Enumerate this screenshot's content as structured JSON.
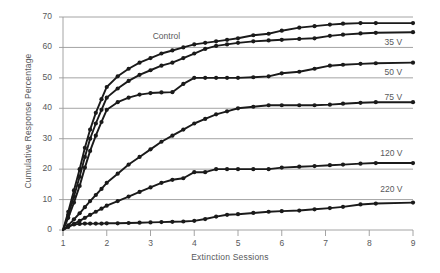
{
  "chart_data": {
    "type": "line",
    "title": "",
    "xlabel": "Extinction Sessions",
    "ylabel": "Cumulative Response Percentage",
    "xlim": [
      1,
      9
    ],
    "ylim": [
      0,
      70
    ],
    "xticks": [
      "1",
      "2",
      "3",
      "4",
      "5",
      "6",
      "7",
      "8",
      "9"
    ],
    "yticks": [
      "0",
      "10",
      "20",
      "30",
      "40",
      "50",
      "60",
      "70"
    ],
    "grid": "horizontal",
    "legend_position": "inline-right",
    "line_color": "#1a1a1a",
    "grid_color": "#9a9a9a",
    "text_color": "#58595b",
    "marker": "filled-circle",
    "series": [
      {
        "name": "Control",
        "label": "Control",
        "label_x": 3.05,
        "label_y": 63.5,
        "x": [
          1.0,
          1.12,
          1.25,
          1.38,
          1.5,
          1.62,
          1.75,
          1.88,
          2.0,
          2.25,
          2.5,
          2.75,
          3.0,
          3.25,
          3.5,
          3.75,
          4.0,
          4.25,
          4.5,
          4.75,
          5.0,
          5.35,
          5.7,
          6.0,
          6.4,
          6.75,
          7.1,
          7.4,
          7.8,
          8.15,
          9.0
        ],
        "values": [
          0.0,
          6.0,
          13.0,
          20.0,
          27.0,
          33.0,
          38.5,
          43.0,
          47.0,
          50.5,
          53.0,
          55.0,
          56.5,
          58.0,
          59.0,
          60.0,
          61.0,
          61.5,
          62.0,
          62.5,
          63.0,
          64.0,
          64.5,
          65.5,
          66.5,
          67.0,
          67.5,
          67.8,
          68.0,
          68.0,
          68.0
        ]
      },
      {
        "name": "35 V",
        "label": "35 V",
        "label_x": 8.35,
        "label_y": 61.5,
        "x": [
          1.0,
          1.12,
          1.25,
          1.38,
          1.5,
          1.62,
          1.75,
          1.88,
          2.0,
          2.25,
          2.5,
          2.75,
          3.0,
          3.25,
          3.5,
          3.75,
          4.0,
          4.25,
          4.5,
          4.75,
          5.0,
          5.35,
          5.7,
          6.0,
          6.4,
          6.75,
          7.1,
          7.4,
          7.8,
          8.15,
          9.0
        ],
        "values": [
          0.0,
          5.0,
          11.0,
          17.5,
          24.0,
          30.0,
          35.0,
          39.5,
          43.5,
          46.5,
          49.0,
          51.0,
          52.5,
          54.0,
          55.0,
          56.5,
          58.0,
          59.5,
          60.5,
          61.0,
          61.5,
          62.0,
          62.3,
          62.5,
          62.8,
          63.0,
          63.8,
          64.2,
          64.6,
          64.8,
          65.0
        ]
      },
      {
        "name": "50 V",
        "label": "50 V",
        "label_x": 8.35,
        "label_y": 51.5,
        "x": [
          1.0,
          1.12,
          1.25,
          1.38,
          1.5,
          1.62,
          1.75,
          1.88,
          2.0,
          2.25,
          2.5,
          2.75,
          3.0,
          3.25,
          3.5,
          3.75,
          4.0,
          4.25,
          4.5,
          4.75,
          5.0,
          5.35,
          5.7,
          6.0,
          6.4,
          6.75,
          7.1,
          7.4,
          7.8,
          8.15,
          9.0
        ],
        "values": [
          0.0,
          4.0,
          9.0,
          14.5,
          20.5,
          26.0,
          31.0,
          35.5,
          39.5,
          42.0,
          43.5,
          44.5,
          45.0,
          45.2,
          45.3,
          48.0,
          50.0,
          50.0,
          50.0,
          50.0,
          50.0,
          50.2,
          50.5,
          51.5,
          52.0,
          53.0,
          54.0,
          54.3,
          54.6,
          54.8,
          55.0
        ]
      },
      {
        "name": "75 V",
        "label": "75 V",
        "label_x": 8.35,
        "label_y": 43.5,
        "x": [
          1.0,
          1.12,
          1.25,
          1.38,
          1.5,
          1.62,
          1.75,
          1.88,
          2.0,
          2.25,
          2.5,
          2.75,
          3.0,
          3.25,
          3.5,
          3.75,
          4.0,
          4.25,
          4.5,
          4.75,
          5.0,
          5.35,
          5.7,
          6.0,
          6.4,
          6.75,
          7.1,
          7.4,
          7.8,
          8.15,
          9.0
        ],
        "values": [
          0.0,
          1.5,
          3.5,
          5.5,
          7.5,
          9.5,
          11.5,
          13.5,
          15.5,
          18.5,
          21.5,
          24.0,
          26.5,
          29.0,
          31.0,
          33.0,
          35.0,
          36.5,
          38.0,
          39.0,
          40.0,
          40.5,
          41.0,
          41.0,
          41.0,
          41.0,
          41.2,
          41.5,
          41.8,
          42.0,
          42.0
        ]
      },
      {
        "name": "120 V",
        "label": "120 V",
        "label_x": 8.25,
        "label_y": 25.0,
        "x": [
          1.0,
          1.12,
          1.25,
          1.38,
          1.5,
          1.62,
          1.75,
          1.88,
          2.0,
          2.25,
          2.5,
          2.75,
          3.0,
          3.25,
          3.5,
          3.75,
          4.0,
          4.25,
          4.5,
          4.75,
          5.0,
          5.35,
          5.7,
          6.0,
          6.4,
          6.75,
          7.1,
          7.4,
          7.8,
          8.15,
          9.0
        ],
        "values": [
          0.0,
          1.0,
          2.0,
          3.0,
          4.0,
          5.0,
          6.0,
          7.0,
          8.0,
          9.5,
          11.0,
          12.5,
          14.0,
          15.5,
          16.5,
          17.0,
          19.0,
          19.0,
          20.0,
          20.0,
          20.0,
          20.0,
          20.0,
          20.5,
          20.8,
          21.0,
          21.3,
          21.5,
          21.8,
          22.0,
          22.0
        ]
      },
      {
        "name": "220 V",
        "label": "220 V",
        "label_x": 8.25,
        "label_y": 13.0,
        "x": [
          1.0,
          1.12,
          1.25,
          1.38,
          1.5,
          1.62,
          1.75,
          1.88,
          2.0,
          2.25,
          2.5,
          2.75,
          3.0,
          3.25,
          3.5,
          3.75,
          4.0,
          4.25,
          4.5,
          4.75,
          5.0,
          5.35,
          5.7,
          6.0,
          6.4,
          6.75,
          7.1,
          7.4,
          7.8,
          8.15,
          9.0
        ],
        "values": [
          0.0,
          1.2,
          1.8,
          2.0,
          2.1,
          2.1,
          2.1,
          2.1,
          2.2,
          2.2,
          2.3,
          2.4,
          2.5,
          2.6,
          2.7,
          2.8,
          3.0,
          3.6,
          4.4,
          5.0,
          5.2,
          5.6,
          6.0,
          6.2,
          6.4,
          6.8,
          7.2,
          7.6,
          8.4,
          8.7,
          9.0
        ]
      }
    ]
  }
}
